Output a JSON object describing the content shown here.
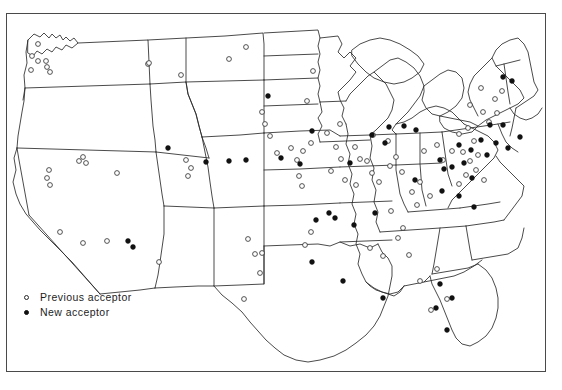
{
  "figure": {
    "kind": "map",
    "region": "contiguous-united-states",
    "border_color": "#4a4a4a",
    "background_color": "#ffffff",
    "outline_color": "#2b2b2b",
    "state_border_color": "#5a5a5a"
  },
  "legend": {
    "items": [
      {
        "marker": "open-circle",
        "label": "Previous acceptor",
        "icon": "open-circle-icon"
      },
      {
        "marker": "filled-circle",
        "label": "New acceptor",
        "icon": "filled-circle-icon"
      }
    ]
  },
  "markers": {
    "previous_acceptor_color": "#ffffff",
    "previous_acceptor_stroke": "#2a2a2a",
    "new_acceptor_color": "#111111",
    "radius": 2.4,
    "previous_acceptor": [
      [
        38,
        44
      ],
      [
        32,
        56
      ],
      [
        38,
        61
      ],
      [
        31,
        70
      ],
      [
        46,
        61
      ],
      [
        47,
        67
      ],
      [
        50,
        72
      ],
      [
        83,
        157
      ],
      [
        79,
        161
      ],
      [
        86,
        163
      ],
      [
        49,
        170
      ],
      [
        47,
        178
      ],
      [
        50,
        185
      ],
      [
        60,
        232
      ],
      [
        83,
        243
      ],
      [
        107,
        241
      ],
      [
        159,
        262
      ],
      [
        148,
        64
      ],
      [
        181,
        75
      ],
      [
        117,
        173
      ],
      [
        149,
        63
      ],
      [
        186,
        160
      ],
      [
        191,
        168
      ],
      [
        188,
        176
      ],
      [
        229,
        59
      ],
      [
        246,
        47
      ],
      [
        262,
        112
      ],
      [
        265,
        124
      ],
      [
        270,
        136
      ],
      [
        248,
        239
      ],
      [
        255,
        254
      ],
      [
        262,
        253
      ],
      [
        260,
        273
      ],
      [
        244,
        299
      ],
      [
        277,
        153
      ],
      [
        291,
        148
      ],
      [
        303,
        151
      ],
      [
        313,
        71
      ],
      [
        307,
        101
      ],
      [
        311,
        143
      ],
      [
        297,
        160
      ],
      [
        299,
        176
      ],
      [
        302,
        186
      ],
      [
        311,
        232
      ],
      [
        305,
        245
      ],
      [
        327,
        133
      ],
      [
        340,
        124
      ],
      [
        336,
        147
      ],
      [
        341,
        159
      ],
      [
        331,
        171
      ],
      [
        345,
        180
      ],
      [
        355,
        147
      ],
      [
        360,
        159
      ],
      [
        356,
        185
      ],
      [
        367,
        161
      ],
      [
        372,
        173
      ],
      [
        379,
        182
      ],
      [
        373,
        135
      ],
      [
        388,
        141
      ],
      [
        390,
        166
      ],
      [
        396,
        157
      ],
      [
        402,
        172
      ],
      [
        391,
        211
      ],
      [
        403,
        228
      ],
      [
        370,
        248
      ],
      [
        383,
        256
      ],
      [
        398,
        238
      ],
      [
        409,
        255
      ],
      [
        417,
        205
      ],
      [
        430,
        196
      ],
      [
        424,
        151
      ],
      [
        437,
        145
      ],
      [
        443,
        160
      ],
      [
        452,
        151
      ],
      [
        459,
        134
      ],
      [
        468,
        128
      ],
      [
        474,
        141
      ],
      [
        463,
        152
      ],
      [
        470,
        161
      ],
      [
        478,
        155
      ],
      [
        481,
        88
      ],
      [
        495,
        99
      ],
      [
        502,
        91
      ],
      [
        489,
        122
      ],
      [
        497,
        113
      ],
      [
        466,
        175
      ],
      [
        459,
        184
      ],
      [
        476,
        170
      ],
      [
        484,
        180
      ],
      [
        470,
        105
      ],
      [
        483,
        112
      ],
      [
        420,
        182
      ],
      [
        412,
        192
      ],
      [
        437,
        269
      ],
      [
        420,
        281
      ],
      [
        447,
        299
      ],
      [
        431,
        310
      ]
    ],
    "new_acceptor": [
      [
        372,
        135
      ],
      [
        404,
        126
      ],
      [
        385,
        143
      ],
      [
        335,
        218
      ],
      [
        375,
        213
      ],
      [
        350,
        163
      ],
      [
        329,
        213
      ],
      [
        415,
        180
      ],
      [
        442,
        191
      ],
      [
        444,
        169
      ],
      [
        472,
        178
      ],
      [
        312,
        131
      ],
      [
        268,
        96
      ],
      [
        206,
        162
      ],
      [
        229,
        161
      ],
      [
        246,
        160
      ],
      [
        300,
        164
      ],
      [
        316,
        220
      ],
      [
        389,
        127
      ],
      [
        416,
        130
      ],
      [
        459,
        145
      ],
      [
        481,
        140
      ],
      [
        452,
        167
      ],
      [
        487,
        155
      ],
      [
        503,
        77
      ],
      [
        512,
        81
      ],
      [
        440,
        284
      ],
      [
        447,
        330
      ],
      [
        354,
        225
      ],
      [
        383,
        298
      ],
      [
        128,
        241
      ],
      [
        133,
        247
      ],
      [
        168,
        148
      ],
      [
        490,
        125
      ],
      [
        312,
        262
      ],
      [
        281,
        158
      ],
      [
        459,
        196
      ],
      [
        474,
        207
      ],
      [
        503,
        125
      ],
      [
        520,
        137
      ],
      [
        452,
        298
      ],
      [
        436,
        308
      ],
      [
        343,
        281
      ],
      [
        471,
        150
      ],
      [
        496,
        143
      ],
      [
        508,
        148
      ],
      [
        440,
        160
      ],
      [
        464,
        163
      ]
    ]
  }
}
